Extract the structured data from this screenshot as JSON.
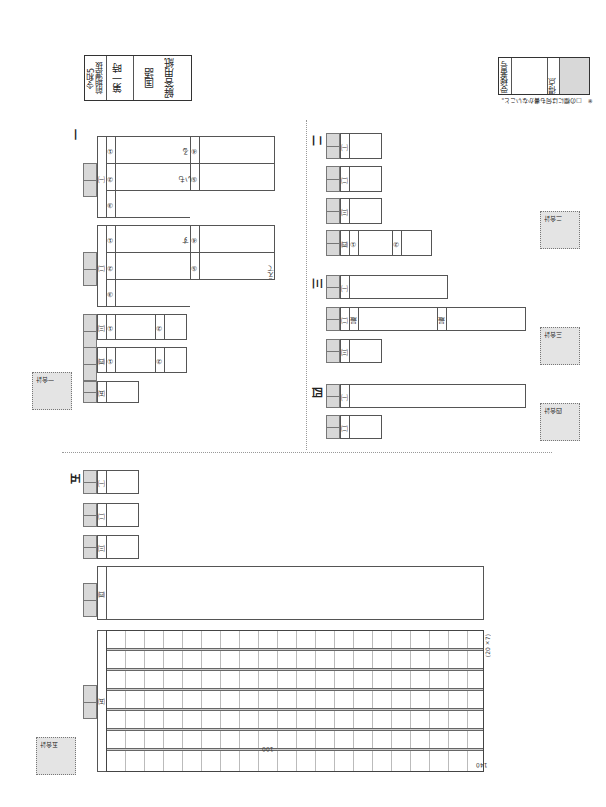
{
  "header": {
    "exam_year": "令和5",
    "exam_type": "前期選抜",
    "period": "第一時",
    "subject": "国語",
    "sheet_title": "解答用紙",
    "examinee_number_label": "受検番号",
    "score_label": "得点",
    "note": "※　□の欄には何も書かないこと。"
  },
  "sections": {
    "s1": {
      "label": "一",
      "q1": "㈠",
      "q2": "㈡",
      "q3": "㈢",
      "q4": "㈣",
      "q5": "㈤",
      "sub1": "①",
      "sub2": "②",
      "sub3": "③",
      "sub4": "④",
      "sub5": "⑤",
      "suffix_ru": "る",
      "suffix_imo": "いも",
      "suffix_su": "す",
      "suffix_ete": "えて",
      "total": "一合計"
    },
    "s2": {
      "label": "二",
      "q1": "㈠",
      "q2": "㈡",
      "q3": "㈢",
      "q4": "㈣",
      "sub1": "①",
      "sub2": "②",
      "total": "二合計"
    },
    "s3": {
      "label": "三",
      "q1": "㈠",
      "q2": "㈡",
      "q3": "㈢",
      "start": "最",
      "end": "最",
      "total": "三合計"
    },
    "s4": {
      "label": "四",
      "q1": "㈠",
      "q2": "㈡",
      "total": "四合計"
    },
    "s5": {
      "label": "五",
      "q1": "㈠",
      "q2": "㈡",
      "q3": "㈢",
      "q4": "㈣",
      "q5": "㈤",
      "grid_size": "(20×7)",
      "marker_100": "100",
      "marker_140": "140",
      "total": "五合計"
    }
  }
}
